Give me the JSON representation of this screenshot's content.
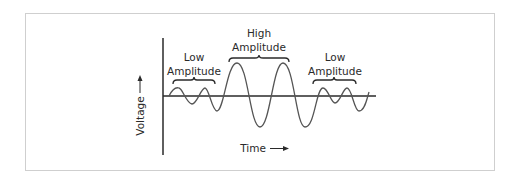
{
  "diagram": {
    "axes": {
      "y_label": "Voltage",
      "x_label": "Time"
    },
    "regions": [
      {
        "id": "low-left",
        "line1": "Low",
        "line2": "Amplitude"
      },
      {
        "id": "high-middle",
        "line1": "High",
        "line2": "Amplitude"
      },
      {
        "id": "low-right",
        "line1": "Low",
        "line2": "Amplitude"
      }
    ],
    "colors": {
      "axis": "#2a2a2a",
      "wave": "#555555",
      "frame": "#cfcfcf",
      "text": "#2a2a2a"
    }
  }
}
